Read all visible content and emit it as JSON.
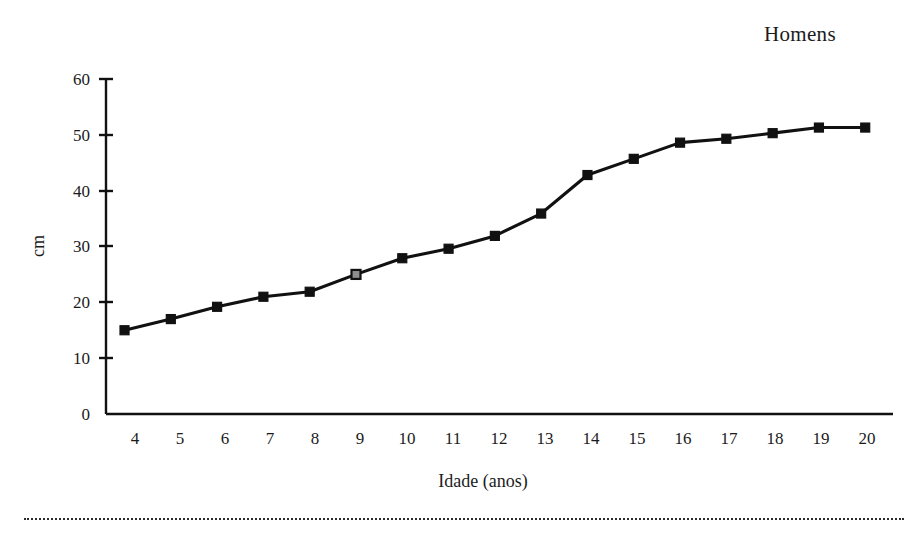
{
  "chart_data": {
    "type": "line",
    "title": "Homens",
    "xlabel": "Idade (anos)",
    "ylabel": "cm",
    "x": [
      4,
      5,
      6,
      7,
      8,
      9,
      10,
      11,
      12,
      13,
      14,
      15,
      16,
      17,
      18,
      19,
      20
    ],
    "values": [
      15.0,
      17.0,
      19.2,
      21.0,
      21.9,
      25.0,
      27.9,
      29.6,
      31.9,
      35.9,
      42.8,
      45.7,
      48.6,
      49.3,
      50.3,
      51.3,
      51.3
    ],
    "series": [
      {
        "name": "Homens",
        "values": [
          15.0,
          17.0,
          19.2,
          21.0,
          21.9,
          25.0,
          27.9,
          29.6,
          31.9,
          35.9,
          42.8,
          45.7,
          48.6,
          49.3,
          50.3,
          51.3,
          51.3
        ]
      }
    ],
    "xticklabels": [
      "4",
      "5",
      "6",
      "7",
      "8",
      "9",
      "10",
      "11",
      "12",
      "13",
      "14",
      "15",
      "16",
      "17",
      "18",
      "19",
      "20"
    ],
    "yticks": [
      0,
      10,
      20,
      30,
      40,
      50,
      60
    ],
    "yticklabels": [
      "0",
      "10",
      "20",
      "30",
      "40",
      "50",
      "60"
    ],
    "ylim": [
      0,
      60
    ],
    "xlim": [
      3.6,
      20.6
    ],
    "grid": false,
    "legend": false,
    "marker": "square",
    "line_color": "#111111",
    "marker_color": "#111111",
    "highlight_marker_color": "#8f8f8f",
    "highlight_marker_index": 5
  },
  "figure": {
    "background_color": "#ffffff",
    "footer_rule": "dotted-separator"
  }
}
